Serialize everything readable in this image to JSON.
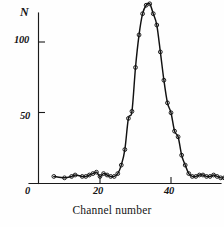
{
  "figure": {
    "kind": "scientific-plot",
    "background_color": "#fefefe",
    "ink_color": "#151515"
  },
  "axes": {
    "y_axis_label": "N",
    "x_axis_title": "Channel number",
    "origin_label": "0",
    "y_ticks": [
      {
        "label": "50",
        "value": 50
      },
      {
        "label": "100",
        "value": 100
      }
    ],
    "x_ticks": [
      {
        "label": "0",
        "value": 0
      },
      {
        "label": "20",
        "value": 20
      },
      {
        "label": "40",
        "value": 40
      }
    ]
  },
  "chart_data": {
    "type": "scatter",
    "title": "",
    "subtitle": "",
    "xlabel": "Channel number",
    "ylabel": "N",
    "xlim": [
      0,
      56
    ],
    "ylim": [
      0,
      132
    ],
    "grid": false,
    "legend": null,
    "annotations": [],
    "marker_style": "open-circle",
    "line_style": "solid-through-points",
    "series": [
      {
        "name": "counts",
        "x": [
          7,
          10,
          12,
          13,
          15,
          16,
          17,
          18,
          19,
          20,
          21,
          22,
          23,
          24,
          25,
          26,
          27,
          28,
          29,
          30,
          31,
          32,
          33,
          34,
          35,
          36,
          37,
          38,
          39,
          40,
          41,
          42,
          43,
          44,
          45,
          46,
          47,
          48,
          49,
          50,
          51,
          52,
          53,
          54,
          55
        ],
        "y": [
          5,
          4,
          5,
          6,
          5,
          5,
          6,
          7,
          8,
          5,
          7,
          6,
          5,
          5,
          7,
          13,
          24,
          46,
          51,
          82,
          105,
          120,
          126,
          127,
          120,
          112,
          93,
          73,
          57,
          50,
          37,
          33,
          20,
          13,
          7,
          5,
          5,
          6,
          6,
          5,
          5,
          6,
          5,
          4,
          4
        ]
      }
    ]
  }
}
